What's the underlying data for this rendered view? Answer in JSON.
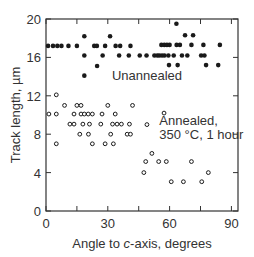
{
  "chart_data": {
    "type": "scatter",
    "title": "",
    "xlabel": "Angle to c-axis, degrees",
    "xlabel_parts": [
      "Angle to ",
      "c",
      "-axis, degrees"
    ],
    "ylabel": "Track length, µm",
    "xlim": [
      0,
      90
    ],
    "ylim": [
      0,
      20
    ],
    "xticks": [
      0,
      30,
      60,
      90
    ],
    "xminor": [
      15,
      45,
      75
    ],
    "yticks": [
      0,
      4,
      8,
      12,
      16,
      20
    ],
    "grid": false,
    "annotations": [
      {
        "text": "Unannealed",
        "x": 32,
        "y": 13.6
      },
      {
        "text": "Annealed,",
        "x": 55,
        "y": 9.0
      },
      {
        "text": "350 °C, 1 hour",
        "x": 55,
        "y": 7.5
      }
    ],
    "series": [
      {
        "name": "Unannealed",
        "marker": "filled-circle",
        "points": [
          [
            1,
            17.2
          ],
          [
            3.4,
            17.2
          ],
          [
            5.5,
            17.2
          ],
          [
            7.5,
            17.2
          ],
          [
            10.9,
            17.2
          ],
          [
            15,
            17.2
          ],
          [
            23.4,
            17.2
          ],
          [
            24.7,
            17.2
          ],
          [
            28.7,
            17.2
          ],
          [
            33.8,
            17.2
          ],
          [
            36,
            17.2
          ],
          [
            41,
            17.2
          ],
          [
            56,
            17.3
          ],
          [
            57.4,
            17.3
          ],
          [
            58.7,
            17.3
          ],
          [
            60,
            17.3
          ],
          [
            63.4,
            17.3
          ],
          [
            65,
            17.3
          ],
          [
            70.6,
            17.3
          ],
          [
            76.4,
            17.3
          ],
          [
            84.4,
            17.3
          ],
          [
            18.6,
            16.2
          ],
          [
            27.5,
            16.2
          ],
          [
            35.5,
            16.2
          ],
          [
            40.2,
            16.2
          ],
          [
            45.5,
            16.2
          ],
          [
            48.8,
            16.2
          ],
          [
            52.6,
            16.2
          ],
          [
            54,
            16.2
          ],
          [
            55,
            16.2
          ],
          [
            56.3,
            16.2
          ],
          [
            57.5,
            16.2
          ],
          [
            59.4,
            16.2
          ],
          [
            62,
            16.2
          ],
          [
            66,
            16.2
          ],
          [
            68.6,
            16.2
          ],
          [
            75.3,
            16.2
          ],
          [
            76.9,
            16.2
          ],
          [
            18.6,
            18.2
          ],
          [
            31.1,
            18.2
          ],
          [
            67.5,
            18.3
          ],
          [
            71.4,
            18.3
          ],
          [
            63.3,
            19.5
          ],
          [
            24.8,
            15.1
          ],
          [
            59.7,
            15.2
          ],
          [
            63.9,
            15.2
          ],
          [
            77.7,
            15.2
          ],
          [
            83.6,
            15.2
          ],
          [
            18.6,
            14.1
          ]
        ]
      },
      {
        "name": "Annealed, 350 °C, 1 hour",
        "marker": "open-circle",
        "points": [
          [
            5,
            12.1
          ],
          [
            9,
            11.0
          ],
          [
            15,
            11.0
          ],
          [
            17,
            11.0
          ],
          [
            30,
            11.0
          ],
          [
            42,
            11.0
          ],
          [
            57.3,
            10.2
          ],
          [
            1.4,
            10.1
          ],
          [
            5,
            10.1
          ],
          [
            13.6,
            10.1
          ],
          [
            17,
            10.1
          ],
          [
            18.6,
            10.1
          ],
          [
            20.5,
            10.1
          ],
          [
            22.5,
            10.1
          ],
          [
            27.2,
            10.1
          ],
          [
            33.6,
            10.1
          ],
          [
            11.6,
            9.05
          ],
          [
            13.6,
            9.05
          ],
          [
            17.9,
            9.05
          ],
          [
            21.1,
            9.05
          ],
          [
            26.6,
            9.05
          ],
          [
            32.3,
            9.05
          ],
          [
            34.5,
            9.05
          ],
          [
            36.6,
            9.05
          ],
          [
            40.5,
            9.05
          ],
          [
            49,
            9.0
          ],
          [
            16.4,
            8.0
          ],
          [
            20.6,
            8.0
          ],
          [
            31.4,
            8.0
          ],
          [
            39.4,
            8.0
          ],
          [
            41,
            8.0
          ],
          [
            5,
            7.0
          ],
          [
            22.5,
            7.0
          ],
          [
            28.7,
            7.0
          ],
          [
            32.7,
            7.0
          ],
          [
            51.4,
            6.0
          ],
          [
            48.4,
            5.15
          ],
          [
            54.7,
            5.15
          ],
          [
            58.4,
            5.15
          ],
          [
            70.6,
            5.15
          ],
          [
            47.5,
            4.0
          ],
          [
            78.8,
            4.0
          ],
          [
            60.8,
            3.05
          ],
          [
            66.7,
            3.05
          ],
          [
            75.6,
            3.05
          ]
        ]
      }
    ]
  },
  "colors": {
    "axis": "#333333",
    "marker": "#1a1a1a",
    "background": "#ffffff"
  }
}
